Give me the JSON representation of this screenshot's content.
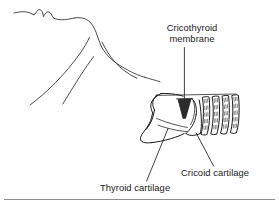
{
  "figure": {
    "background_color": "#ffffff",
    "line_color": "#1a1a1a",
    "text_color": "#1c1c1c",
    "rule_color": "#8e8e8e"
  },
  "labels": {
    "cricothyroid": {
      "line1": "Cricothyroid",
      "line2": "membrane"
    },
    "thyroid": "Thyroid cartilage",
    "cricoid": "Cricoid cartilage"
  },
  "icons": {
    "profile": "head-neck-profile-outline",
    "larynx": "larynx-cartilage-outline",
    "membrane": "cricothyroid-membrane-wedge",
    "trachea": "tracheal-rings",
    "leader": "leader-line"
  }
}
